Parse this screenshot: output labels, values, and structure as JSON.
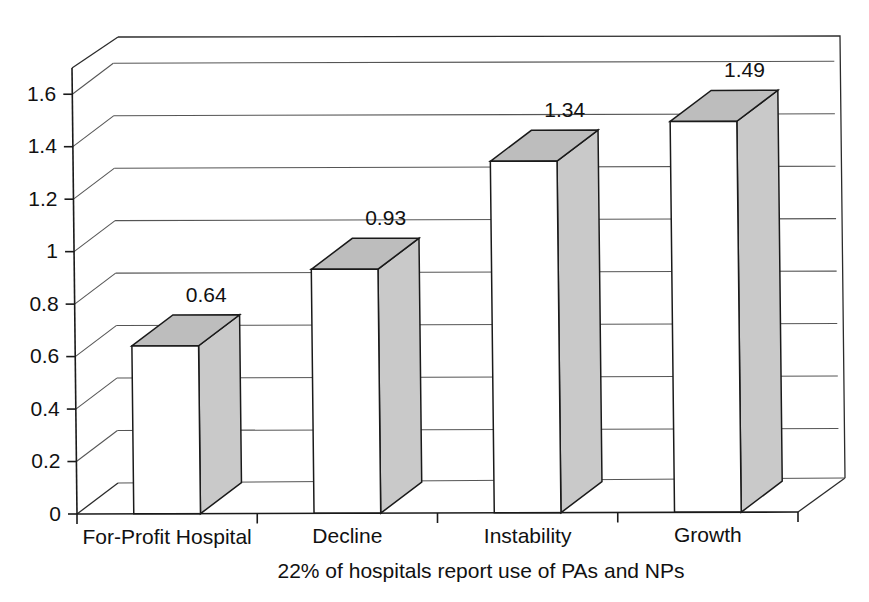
{
  "chart_data": {
    "type": "bar",
    "title": "",
    "subtitle": "",
    "xlabel": "22% of hospitals report use of PAs and NPs",
    "ylabel": "",
    "categories": [
      "For-Profit Hospital",
      "Decline",
      "Instability",
      "Growth"
    ],
    "values": [
      0.64,
      0.93,
      1.34,
      1.49
    ],
    "value_labels": [
      "0.64",
      "0.93",
      "1.34",
      "1.49"
    ],
    "ylim": [
      0,
      1.7
    ],
    "ytick_values": [
      0,
      0.2,
      0.4,
      0.6,
      0.8,
      1,
      1.2,
      1.4,
      1.6
    ],
    "ytick_labels": [
      "0",
      "0.2",
      "0.4",
      "0.6",
      "0.8",
      "1",
      "1.2",
      "1.4",
      "1.6"
    ],
    "grid": true,
    "legend": "none",
    "style": "3d-column",
    "series": [
      {
        "name": "Mean score",
        "values": [
          0.64,
          0.93,
          1.34,
          1.49
        ]
      }
    ],
    "colors": {
      "bar_front": "#ffffff",
      "bar_side": "#c9c9c9",
      "bar_top": "#bdbdbd",
      "axis": "#1a1a1a",
      "grid": "#555555",
      "background": "#ffffff",
      "text": "#111111"
    }
  },
  "footer": {
    "text": "22% of hospitals report use of PAs and NPs"
  }
}
